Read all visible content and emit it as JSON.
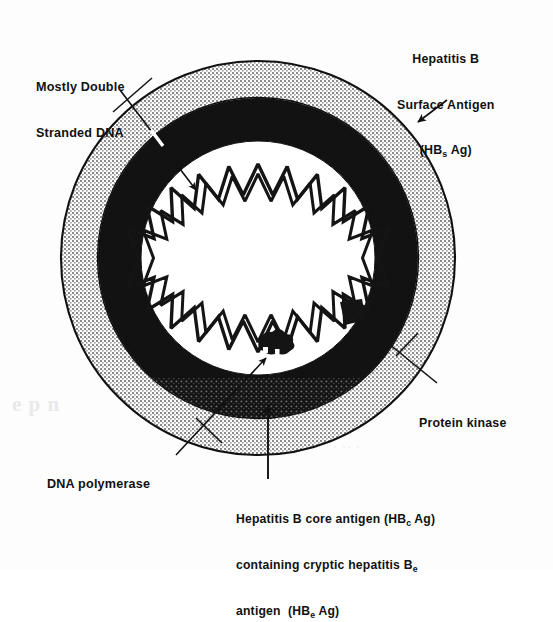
{
  "figure": {
    "background_color": "#fdfdfd",
    "ink_color": "#111111"
  },
  "labels": {
    "dna": {
      "name": "mostly-double-stranded-dna",
      "line1": "Mostly Double",
      "line2": "Stranded DNA"
    },
    "surface_antigen": {
      "name": "hepatitis-b-surface-antigen",
      "line1": "Hepatitis B",
      "line2": "Surface Antigen",
      "paren_open": "(HB",
      "subscript": "s",
      "paren_close": " Ag)"
    },
    "protein_kinase": {
      "name": "protein-kinase",
      "text": "Protein kinase"
    },
    "dna_polymerase": {
      "name": "dna-polymerase",
      "text": "DNA polymerase"
    },
    "core_antigen": {
      "name": "hepatitis-b-core-antigen",
      "line1_a": "Hepatitis B core antigen (HB",
      "line1_sub": "c",
      "line1_b": " Ag)",
      "line2_a": "containing cryptic hepatitis B",
      "line2_sub": "e",
      "line3_a": "antigen  (HB",
      "line3_sub": "e",
      "line3_b": " Ag)"
    }
  },
  "structure": {
    "center_x": 258,
    "center_y": 258,
    "envelope_outer_radius": 197,
    "envelope_inner_radius": 160,
    "capsid_outer_radius": 160,
    "capsid_inner_radius": 117,
    "dna_outer_radius": 92,
    "dna_inner_radius": 62,
    "dna_teeth": 21,
    "envelope_fill": "#cfcfcf",
    "capsid_fill": "#111111",
    "lumen_fill": "#ffffff",
    "outline_stroke": "#111111"
  },
  "markers": {
    "protein_kinase_blob": {
      "cx": 352,
      "cy": 312,
      "w": 26,
      "h": 24
    },
    "dna_polymerase_blob": {
      "cx": 271,
      "cy": 346,
      "w": 30,
      "h": 24
    }
  },
  "artifacts": {
    "left_bleed": "e  p   n",
    "mid_bleed": "· ·· ·"
  }
}
